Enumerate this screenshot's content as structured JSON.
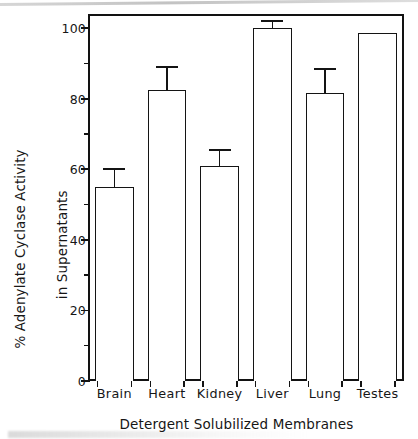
{
  "figure": {
    "alt_title": "% Adenylate Cyclase Activity in Supernatants of Detergent Solubilized Membranes"
  },
  "chart_data": {
    "type": "bar",
    "title": "",
    "subtitle": "",
    "xlabel": "Detergent Solubilized Membranes",
    "ylabel_line1": "% Adenylate Cyclase Activity",
    "ylabel_line2": "in Supernatants",
    "categories": [
      "Brain",
      "Heart",
      "Kidney",
      "Liver",
      "Lung",
      "Testes"
    ],
    "values": [
      55,
      82.5,
      61,
      100,
      81.5,
      98.5
    ],
    "error_high": [
      60,
      89,
      65.5,
      102,
      88.5,
      null
    ],
    "has_error_bars": [
      true,
      true,
      true,
      true,
      true,
      false
    ],
    "ylim": [
      0,
      104
    ],
    "xlim_note": "categorical",
    "ytick_major": [
      0,
      20,
      40,
      60,
      80,
      100
    ],
    "ytick_major_labels": [
      "0",
      "20",
      "40",
      "60",
      "80",
      "100"
    ],
    "ytick_minor": [
      10,
      30,
      50,
      70,
      90
    ],
    "grid": false,
    "legend": false,
    "legend_position": "none",
    "bar_fill": "#ffffff",
    "bar_edge_color": "#141414",
    "axis_color": "#121212",
    "background": "#ffffff",
    "annotations": []
  }
}
